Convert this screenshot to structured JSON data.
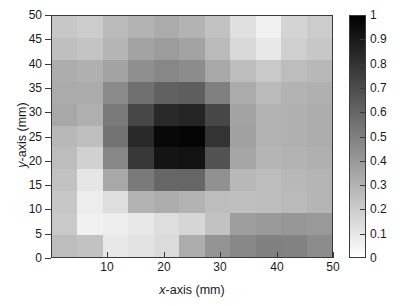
{
  "chart_data": {
    "type": "heatmap",
    "title": "",
    "xlabel": "x-axis (mm)",
    "ylabel": "y-axis (mm)",
    "xlim": [
      0,
      50
    ],
    "ylim": [
      0,
      50
    ],
    "grid": false,
    "colormap": "gray-inverted",
    "colorbar": {
      "position": "right",
      "min": 0,
      "max": 1,
      "tick_values": [
        1,
        0.9,
        0.8,
        0.7,
        0.6,
        0.5,
        0.4,
        0.3,
        0.2,
        0.1,
        0
      ],
      "tick_labels": [
        "1",
        "0.9",
        "0.8",
        "0.7",
        "0.6",
        "0.5",
        "0.4",
        "0.3",
        "0.2",
        "0.1",
        "0"
      ],
      "low_color": "#ffffff",
      "high_color": "#000000"
    },
    "x_tick_values": [
      10,
      20,
      30,
      40,
      50
    ],
    "x_tick_labels": [
      "10",
      "20",
      "30",
      "40",
      "50"
    ],
    "y_tick_values": [
      0,
      5,
      10,
      15,
      20,
      25,
      30,
      35,
      40,
      45,
      50
    ],
    "y_tick_labels": [
      "0",
      "5",
      "10",
      "15",
      "20",
      "25",
      "30",
      "35",
      "40",
      "45",
      "50"
    ],
    "x_cell_centers": [
      2.3,
      6.8,
      11.4,
      15.9,
      20.5,
      25.0,
      29.5,
      34.1,
      38.6,
      43.2,
      47.7
    ],
    "y_cell_centers": [
      2.3,
      6.8,
      11.4,
      15.9,
      20.5,
      25.0,
      29.5,
      34.1,
      38.6,
      43.2,
      47.7
    ],
    "values_note": "rows listed top (y=47.7) to bottom (y=2.3); columns left (x=2.3) to right (x=47.7)",
    "values": [
      [
        0.22,
        0.2,
        0.27,
        0.3,
        0.33,
        0.3,
        0.24,
        0.12,
        0.06,
        0.17,
        0.2
      ],
      [
        0.25,
        0.23,
        0.29,
        0.36,
        0.39,
        0.36,
        0.27,
        0.15,
        0.09,
        0.19,
        0.22
      ],
      [
        0.32,
        0.31,
        0.36,
        0.44,
        0.47,
        0.45,
        0.34,
        0.26,
        0.21,
        0.26,
        0.28
      ],
      [
        0.33,
        0.33,
        0.46,
        0.56,
        0.62,
        0.63,
        0.5,
        0.33,
        0.27,
        0.3,
        0.31
      ],
      [
        0.34,
        0.31,
        0.52,
        0.72,
        0.84,
        0.86,
        0.72,
        0.36,
        0.3,
        0.31,
        0.32
      ],
      [
        0.28,
        0.25,
        0.55,
        0.84,
        0.97,
        0.98,
        0.8,
        0.37,
        0.3,
        0.31,
        0.32
      ],
      [
        0.26,
        0.18,
        0.47,
        0.78,
        0.92,
        0.93,
        0.68,
        0.35,
        0.29,
        0.3,
        0.31
      ],
      [
        0.24,
        0.1,
        0.34,
        0.52,
        0.6,
        0.6,
        0.43,
        0.28,
        0.26,
        0.28,
        0.29
      ],
      [
        0.22,
        0.07,
        0.13,
        0.3,
        0.32,
        0.3,
        0.26,
        0.25,
        0.26,
        0.27,
        0.29
      ],
      [
        0.21,
        0.06,
        0.07,
        0.09,
        0.13,
        0.16,
        0.24,
        0.38,
        0.4,
        0.41,
        0.4
      ],
      [
        0.26,
        0.24,
        0.09,
        0.11,
        0.14,
        0.32,
        0.42,
        0.47,
        0.5,
        0.49,
        0.45
      ]
    ]
  },
  "axes": {
    "x_title": "x-axis (mm)",
    "x_title_italic_prefix": "x",
    "x_title_rest": "-axis (mm)",
    "y_title": "y-axis (mm)",
    "y_title_italic_prefix": "y",
    "y_title_rest": "-axis (mm)"
  }
}
